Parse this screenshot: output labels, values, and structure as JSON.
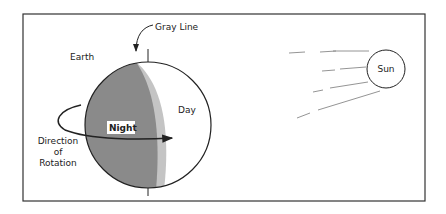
{
  "diagram": {
    "labels": {
      "gray_line": "Gray Line",
      "earth": "Earth",
      "day": "Day",
      "night": "Night",
      "direction_line1": "Direction",
      "direction_line2": "of",
      "direction_line3": "Rotation",
      "sun": "Sun"
    },
    "colors": {
      "night": "#8a8a8a",
      "gray_line": "#c4c4c4",
      "day": "#ffffff",
      "stroke": "#222222"
    }
  }
}
